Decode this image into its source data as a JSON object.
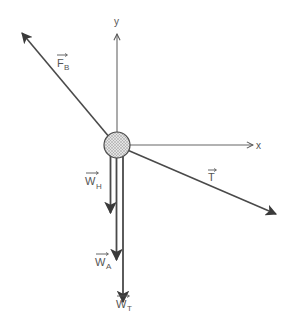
{
  "diagram": {
    "type": "free-body-diagram",
    "colors": {
      "line": "#555555",
      "axis": "#666666",
      "text": "#555555",
      "body_fill": "#cfcfcf"
    },
    "axes": {
      "x_label": "x",
      "y_label": "y"
    },
    "body": {
      "shape": "circle",
      "fill": "stippled"
    },
    "vectors": [
      {
        "id": "FB",
        "symbol": "F",
        "subscript": "B",
        "direction": "up-left"
      },
      {
        "id": "T",
        "symbol": "T",
        "subscript": "",
        "direction": "down-right"
      },
      {
        "id": "WH",
        "symbol": "W",
        "subscript": "H",
        "direction": "down",
        "length_rank": 1
      },
      {
        "id": "WA",
        "symbol": "W",
        "subscript": "A",
        "direction": "down",
        "length_rank": 2
      },
      {
        "id": "WT",
        "symbol": "W",
        "subscript": "T",
        "direction": "down",
        "length_rank": 3
      }
    ]
  }
}
